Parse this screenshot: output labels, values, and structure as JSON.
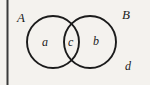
{
  "figure": {
    "type": "venn-diagram",
    "background_color": "#f4f2ee",
    "stroke_color": "#1b1b1b",
    "sets": [
      {
        "id": "A",
        "label": "A",
        "cx": 53,
        "cy": 42,
        "r": 26
      },
      {
        "id": "B",
        "label": "B",
        "cx": 90,
        "cy": 42,
        "r": 26
      }
    ],
    "regions": [
      {
        "id": "a",
        "label": "a",
        "meaning": "A only"
      },
      {
        "id": "c",
        "label": "c",
        "meaning": "A and B"
      },
      {
        "id": "b",
        "label": "b",
        "meaning": "B only"
      },
      {
        "id": "d",
        "label": "d",
        "meaning": "outside A and B"
      }
    ],
    "border": {
      "side": "left",
      "label": "left-rule"
    }
  },
  "labels": {
    "set_a": "A",
    "set_b": "B",
    "region_a": "a",
    "region_c": "c",
    "region_b": "b",
    "region_d": "d"
  }
}
